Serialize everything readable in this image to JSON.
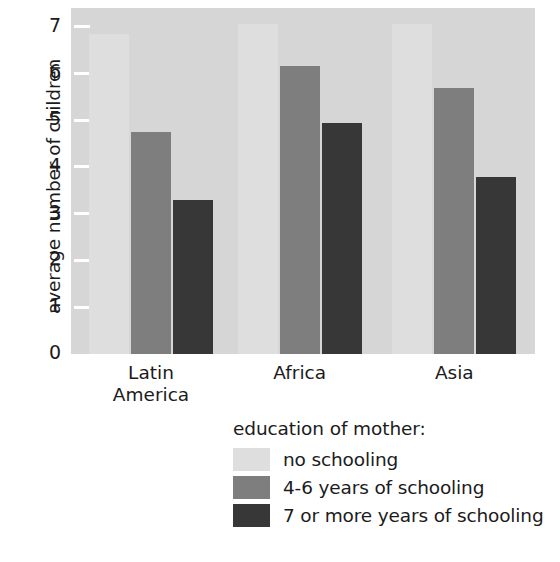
{
  "chart_data": {
    "type": "bar",
    "title": "",
    "subtitle": "",
    "xlabel": "",
    "ylabel": "average number of children",
    "ylim": [
      0,
      7.4
    ],
    "yticks": [
      0,
      1,
      2,
      3,
      4,
      5,
      6,
      7
    ],
    "ytick_labels": [
      "0",
      "1",
      "2",
      "3",
      "4",
      "5",
      "6",
      "7"
    ],
    "grid": false,
    "legend_position": "below-plot",
    "legend_title": "education of mother:",
    "categories": [
      "Latin America",
      "Africa",
      "Asia"
    ],
    "category_lines": [
      [
        "Latin",
        "America"
      ],
      [
        "Africa",
        ""
      ],
      [
        "Asia",
        ""
      ]
    ],
    "series": [
      {
        "name": "no schooling",
        "color": "#dedede",
        "values": [
          6.85,
          7.05,
          7.05
        ]
      },
      {
        "name": "4-6 years of schooling",
        "color": "#7e7e7e",
        "values": [
          4.75,
          6.15,
          5.7
        ]
      },
      {
        "name": "7 or more years of schooling",
        "color": "#373737",
        "values": [
          3.3,
          4.95,
          3.78
        ]
      }
    ],
    "plot_background": "#d6d6d6",
    "page_background": "#ffffff",
    "text_color": "#1b1b1b"
  }
}
